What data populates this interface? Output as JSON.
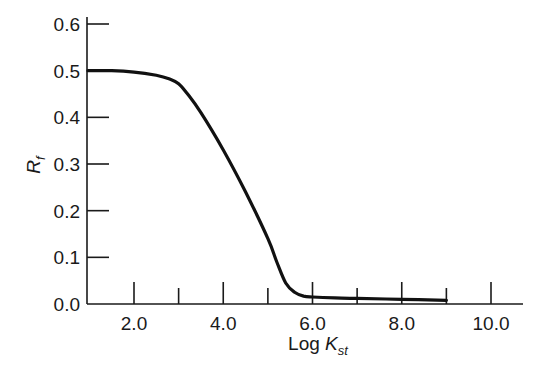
{
  "chart_data": {
    "type": "line",
    "title": "",
    "xlabel": "Log K_st",
    "xlabel_main": "Log ",
    "xlabel_var": "K",
    "xlabel_sub": "st",
    "ylabel": "R_f",
    "ylabel_var": "R",
    "ylabel_sub": "f",
    "xlim": [
      1.0,
      10.5
    ],
    "ylim": [
      0.0,
      0.6
    ],
    "x_ticks": [
      2.0,
      3.0,
      4.0,
      5.0,
      6.0,
      7.0,
      8.0,
      9.0,
      10.0
    ],
    "x_tick_labels": [
      "2.0",
      "4.0",
      "6.0",
      "8.0",
      "10.0"
    ],
    "x_tick_label_values": [
      2.0,
      4.0,
      6.0,
      8.0,
      10.0
    ],
    "y_ticks": [
      0.0,
      0.1,
      0.2,
      0.3,
      0.4,
      0.5,
      0.6
    ],
    "y_tick_labels": [
      "0.0",
      "0.1",
      "0.2",
      "0.3",
      "0.4",
      "0.5",
      "0.6"
    ],
    "grid": false,
    "legend": null,
    "series": [
      {
        "name": "R_f vs Log K_st",
        "color": "#111111",
        "x": [
          1.0,
          1.5,
          2.0,
          2.5,
          2.8,
          3.0,
          3.2,
          3.5,
          4.0,
          4.5,
          5.0,
          5.2,
          5.4,
          5.6,
          5.8,
          6.0,
          6.5,
          7.0,
          8.0,
          9.0
        ],
        "y": [
          0.5,
          0.5,
          0.497,
          0.49,
          0.482,
          0.472,
          0.45,
          0.41,
          0.33,
          0.24,
          0.14,
          0.09,
          0.045,
          0.025,
          0.017,
          0.015,
          0.013,
          0.012,
          0.01,
          0.008
        ]
      }
    ]
  }
}
